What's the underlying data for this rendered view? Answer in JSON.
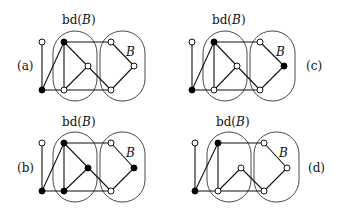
{
  "figure": {
    "panels": [
      {
        "id": "a",
        "label": "(a)",
        "bd_label": "bd(",
        "bd_var": "B",
        "bd_close": ")",
        "set_label": "B",
        "filled_nodes": [
          "top_black",
          "bottom_left"
        ],
        "has_top_mid_edge": true
      },
      {
        "id": "b",
        "label": "(b)",
        "bd_label": "bd(",
        "bd_var": "B",
        "bd_close": ")",
        "set_label": "B",
        "filled_nodes": [
          "top_black",
          "mid",
          "right",
          "bottom_left",
          "bottom_mid"
        ],
        "has_top_mid_edge": true
      },
      {
        "id": "c",
        "label": "(c)",
        "bd_label": "bd(",
        "bd_var": "B",
        "bd_close": ")",
        "set_label": "B",
        "filled_nodes": [
          "top_black",
          "right",
          "bottom_left"
        ],
        "has_top_mid_edge": true
      },
      {
        "id": "d",
        "label": "(d)",
        "bd_label": "bd(",
        "bd_var": "B",
        "bd_close": ")",
        "set_label": "B",
        "filled_nodes": [
          "top_black",
          "bottom_left"
        ],
        "has_top_mid_edge": false
      }
    ]
  }
}
